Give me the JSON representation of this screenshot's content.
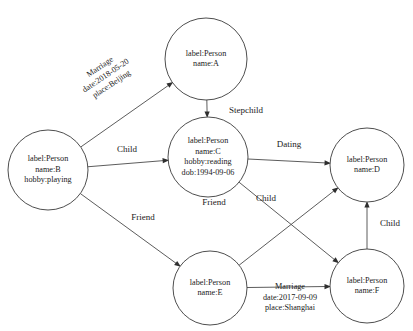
{
  "diagram": {
    "type": "property-graph",
    "width": 413,
    "height": 331,
    "background_color": "#ffffff",
    "node_stroke_color": "#3a3a3a",
    "edge_stroke_color": "#4a4a4a",
    "text_color": "#1a1a1a"
  },
  "nodes": [
    {
      "id": "A",
      "cx": 206,
      "cy": 59,
      "r": 41,
      "lines": [
        "label:Person",
        "name:A"
      ]
    },
    {
      "id": "B",
      "cx": 48,
      "cy": 170,
      "r": 40,
      "lines": [
        "label:Person",
        "name:B",
        "hobby:playing"
      ]
    },
    {
      "id": "C",
      "cx": 208,
      "cy": 157,
      "r": 40,
      "lines": [
        "label:Person",
        "name:C",
        "hobby:reading",
        "dob:1994-09-06"
      ]
    },
    {
      "id": "D",
      "cx": 367,
      "cy": 165,
      "r": 37,
      "lines": [
        "label:Person",
        "name:D"
      ]
    },
    {
      "id": "E",
      "cx": 210,
      "cy": 288,
      "r": 37,
      "lines": [
        "label:Person",
        "name:E"
      ]
    },
    {
      "id": "F",
      "cx": 367,
      "cy": 286,
      "r": 37,
      "lines": [
        "label:Person",
        "name:F"
      ]
    }
  ],
  "edges": [
    {
      "id": "b-to-a",
      "from": "B",
      "to": "A",
      "label_lines": [
        "Marriage",
        "date:2018-05-20",
        "place:Beijing"
      ],
      "label_x": 106,
      "label_y": 76,
      "rotation": -34
    },
    {
      "id": "a-to-c",
      "from": "A",
      "to": "C",
      "label_lines": [
        "Stepchild"
      ],
      "label_x": 246,
      "label_y": 111,
      "rotation": 0
    },
    {
      "id": "b-to-c",
      "from": "B",
      "to": "C",
      "label_lines": [
        "Child"
      ],
      "label_x": 127,
      "label_y": 150,
      "rotation": 0
    },
    {
      "id": "c-to-d",
      "from": "C",
      "to": "D",
      "label_lines": [
        "Dating"
      ],
      "label_x": 289,
      "label_y": 145,
      "rotation": 0
    },
    {
      "id": "c-to-f",
      "from": "C",
      "to": "F",
      "label_lines": [
        "Friend"
      ],
      "label_x": 214,
      "label_y": 203,
      "rotation": 0
    },
    {
      "id": "b-to-e",
      "from": "B",
      "to": "E",
      "label_lines": [
        "Friend"
      ],
      "label_x": 143,
      "label_y": 218,
      "rotation": 0
    },
    {
      "id": "e-to-d",
      "from": "E",
      "to": "D",
      "label_lines": [
        "Child"
      ],
      "label_x": 266,
      "label_y": 199,
      "rotation": 0
    },
    {
      "id": "f-to-d",
      "from": "F",
      "to": "D",
      "label_lines": [
        "Child"
      ],
      "label_x": 390,
      "label_y": 224,
      "rotation": 0
    },
    {
      "id": "e-to-f",
      "from": "E",
      "to": "F",
      "label_lines": [
        "Marriage",
        "date:2017-09-09",
        "place:Shanghai"
      ],
      "label_x": 290,
      "label_y": 298,
      "rotation": 0
    }
  ]
}
